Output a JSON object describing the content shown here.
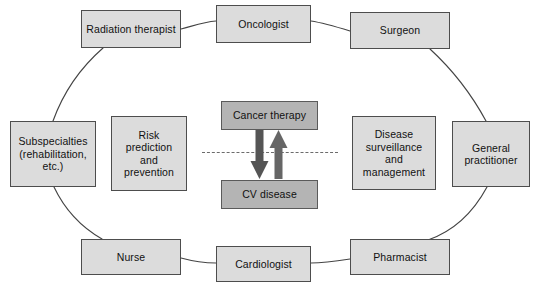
{
  "diagram": {
    "type": "cycle-diagram",
    "colors": {
      "node_fill": "#dcdcdc",
      "node_border": "#4d4d4d",
      "core_fill": "#b4b4b4",
      "core_border": "#5a5a5a",
      "connector": "#444444",
      "dashed_divider": "#6b6b6b",
      "arrow_fill": "#555555",
      "background": "#ffffff"
    },
    "ring_nodes": [
      {
        "id": "radiation-therapist",
        "label": "Radiation therapist",
        "x": 81,
        "y": 10,
        "w": 100,
        "h": 38
      },
      {
        "id": "oncologist",
        "label": "Oncologist",
        "x": 216,
        "y": 5,
        "w": 95,
        "h": 38
      },
      {
        "id": "surgeon",
        "label": "Surgeon",
        "x": 350,
        "y": 12,
        "w": 100,
        "h": 37
      },
      {
        "id": "general-practitioner",
        "label": "General\npractitioner",
        "x": 452,
        "y": 121,
        "w": 78,
        "h": 66
      },
      {
        "id": "pharmacist",
        "label": "Pharmacist",
        "x": 350,
        "y": 239,
        "w": 100,
        "h": 36
      },
      {
        "id": "cardiologist",
        "label": "Cardiologist",
        "x": 216,
        "y": 246,
        "w": 95,
        "h": 36
      },
      {
        "id": "nurse",
        "label": "Nurse",
        "x": 81,
        "y": 239,
        "w": 100,
        "h": 36
      },
      {
        "id": "subspecialties",
        "label": "Subspecialties\n(rehabilitation,\netc.)",
        "x": 10,
        "y": 121,
        "w": 86,
        "h": 66
      }
    ],
    "inner_nodes": [
      {
        "id": "risk-prediction-and-prevention",
        "label": "Risk\nprediction\nand\nprevention",
        "x": 111,
        "y": 116,
        "w": 76,
        "h": 75
      },
      {
        "id": "disease-surveillance-and-management",
        "label": "Disease\nsurveillance\nand\nmanagement",
        "x": 352,
        "y": 116,
        "w": 84,
        "h": 74
      }
    ],
    "core_nodes": [
      {
        "id": "cancer-therapy",
        "label": "Cancer therapy",
        "x": 221,
        "y": 101,
        "w": 97,
        "h": 29
      },
      {
        "id": "cv-disease",
        "label": "CV disease",
        "x": 221,
        "y": 180,
        "w": 97,
        "h": 29
      }
    ],
    "divider": {
      "id": "dashed-divider",
      "x": 202,
      "y": 152,
      "w": 136
    },
    "arrows": [
      {
        "id": "down-arrow-cancer-to-cv",
        "direction": "down",
        "x": 252,
        "y": 131,
        "w": 17,
        "h": 48
      },
      {
        "id": "up-arrow-cv-to-cancer",
        "direction": "up",
        "x": 271,
        "y": 131,
        "w": 17,
        "h": 48
      }
    ]
  }
}
